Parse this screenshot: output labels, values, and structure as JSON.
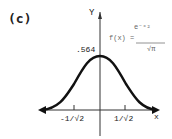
{
  "panel_label": "(c)",
  "axes": {
    "x_label": "x",
    "y_label": "Y"
  },
  "peak_value": ".564",
  "ticks": {
    "negative": "-1/√2",
    "positive": "1/√2"
  },
  "formula": {
    "lhs": "f(x) =",
    "numerator": "e⁻ˣ²",
    "denominator": "√π"
  },
  "curve": {
    "type": "gaussian",
    "peak": 0.564,
    "function": "f(x) = e^(-x^2)/sqrt(pi)"
  }
}
